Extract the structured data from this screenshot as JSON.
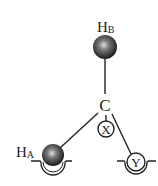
{
  "diagram": {
    "type": "molecular-structure",
    "center_atom": {
      "label": "C"
    },
    "atoms": [
      {
        "id": "HB",
        "label": "H",
        "subscript": "B",
        "style": "shaded-sphere"
      },
      {
        "id": "HA",
        "label": "H",
        "subscript": "A",
        "style": "shaded-sphere-in-cradle"
      },
      {
        "id": "X",
        "label": "X",
        "style": "open-circle"
      },
      {
        "id": "Y",
        "label": "Y",
        "style": "open-circle-in-cradle"
      }
    ],
    "bonds": [
      {
        "from": "C",
        "to": "HB"
      },
      {
        "from": "C",
        "to": "HA"
      },
      {
        "from": "C",
        "to": "X"
      },
      {
        "from": "C",
        "to": "Y"
      }
    ],
    "colors": {
      "line": "#222222",
      "sphere_dark": "#1a1a1a",
      "sphere_highlight": "#d8d8d8",
      "background": "#ffffff"
    }
  }
}
